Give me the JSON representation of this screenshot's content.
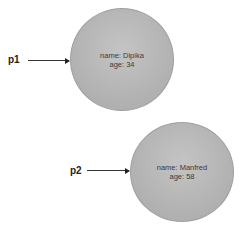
{
  "diagram": {
    "references": [
      {
        "label": "p1",
        "target": 0
      },
      {
        "label": "p2",
        "target": 1
      }
    ],
    "objects": [
      {
        "name_line": "name: Dipika",
        "age_line": "age: 34"
      },
      {
        "name_line": "name: Manfred",
        "age_line": "age: 58"
      }
    ],
    "colors": {
      "object_fill": "#b8b8b8",
      "arrow": "#333333",
      "text": "#3a3a3a"
    }
  }
}
